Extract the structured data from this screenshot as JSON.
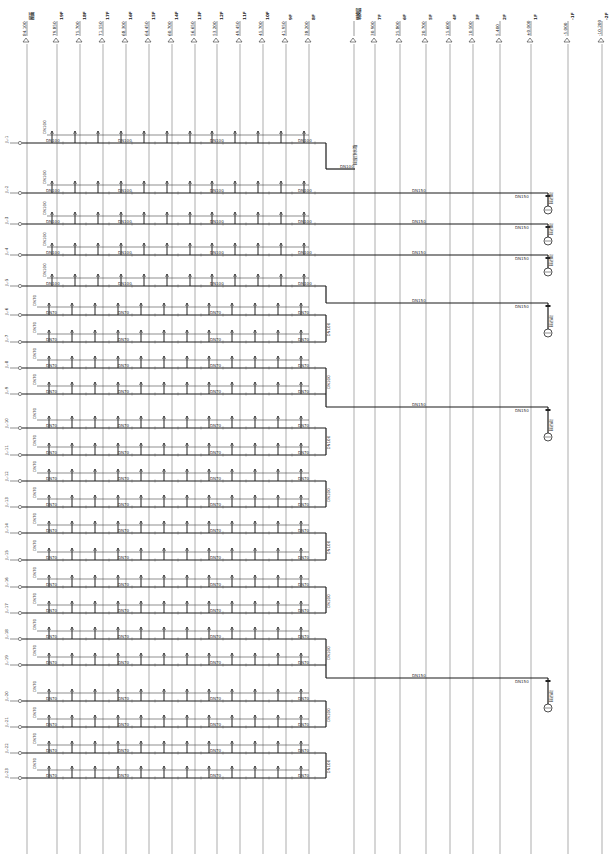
{
  "drawing": {
    "title": "Water supply riser system diagram",
    "width": 610,
    "height": 854
  },
  "levels": [
    {
      "x": 27,
      "elevation": "84.100",
      "floor": "屋面"
    },
    {
      "x": 57,
      "elevation": "79.850",
      "floor": "19F"
    },
    {
      "x": 80,
      "elevation": "75.700",
      "floor": "18F"
    },
    {
      "x": 103,
      "elevation": "71.550",
      "floor": "17F"
    },
    {
      "x": 126,
      "elevation": "68.300",
      "floor": "16F"
    },
    {
      "x": 149,
      "elevation": "64.450",
      "floor": "15F"
    },
    {
      "x": 172,
      "elevation": "60.700",
      "floor": "14F"
    },
    {
      "x": 195,
      "elevation": "56.650",
      "floor": "13F"
    },
    {
      "x": 217,
      "elevation": "53.200",
      "floor": "12F"
    },
    {
      "x": 240,
      "elevation": "49.450",
      "floor": "11F"
    },
    {
      "x": 263,
      "elevation": "45.700",
      "floor": "10F"
    },
    {
      "x": 286,
      "elevation": "41.950",
      "floor": "9F"
    },
    {
      "x": 309,
      "elevation": "38.200",
      "floor": "8F"
    },
    {
      "x": 354,
      "elevation": "",
      "floor": "转换层"
    },
    {
      "x": 375,
      "elevation": "30.900",
      "floor": "7F"
    },
    {
      "x": 400,
      "elevation": "25.800",
      "floor": "6F"
    },
    {
      "x": 426,
      "elevation": "20.700",
      "floor": "5F"
    },
    {
      "x": 450,
      "elevation": "15.600",
      "floor": "4F"
    },
    {
      "x": 473,
      "elevation": "10.500",
      "floor": "3F"
    },
    {
      "x": 500,
      "elevation": "5.400",
      "floor": "2F"
    },
    {
      "x": 531,
      "elevation": "±0.000",
      "floor": "1F"
    },
    {
      "x": 568,
      "elevation": "-5.000",
      "floor": "-1F"
    },
    {
      "x": 602,
      "elevation": "-10.200",
      "floor": "-2F"
    }
  ],
  "risers": [
    {
      "y": 143,
      "tag": "JL-1",
      "pipe": "DN100",
      "riser_label": "JL-1"
    },
    {
      "y": 193,
      "tag": "JL-2",
      "pipe": "DN100",
      "riser_label": "JL-2"
    },
    {
      "y": 224,
      "tag": "JL-3",
      "pipe": "DN100",
      "riser_label": "JL-3"
    },
    {
      "y": 255,
      "tag": "JL-4",
      "pipe": "DN100",
      "riser_label": "JL-4"
    },
    {
      "y": 286,
      "tag": "JL-5",
      "pipe": "DN100",
      "riser_label": "JL-5"
    },
    {
      "y": 315,
      "tag": "JL-6",
      "pipe": "DN70",
      "riser_label": "JL-6"
    },
    {
      "y": 342,
      "tag": "JL-7",
      "pipe": "DN70",
      "riser_label": "JL-7"
    },
    {
      "y": 368,
      "tag": "JL-8",
      "pipe": "DN70",
      "riser_label": "JL-8"
    },
    {
      "y": 394,
      "tag": "JL-9",
      "pipe": "DN70",
      "riser_label": "JL-9"
    },
    {
      "y": 428,
      "tag": "JL-10",
      "pipe": "DN70",
      "riser_label": "JL-10"
    },
    {
      "y": 455,
      "tag": "JL-11",
      "pipe": "DN70",
      "riser_label": "JL-11"
    },
    {
      "y": 481,
      "tag": "JL-12",
      "pipe": "DN70",
      "riser_label": "JL-12"
    },
    {
      "y": 507,
      "tag": "JL-13",
      "pipe": "DN70",
      "riser_label": "JL-13"
    },
    {
      "y": 533,
      "tag": "JL-14",
      "pipe": "DN70",
      "riser_label": "JL-14"
    },
    {
      "y": 560,
      "tag": "JL-15",
      "pipe": "DN70",
      "riser_label": "JL-15"
    },
    {
      "y": 587,
      "tag": "JL-16",
      "pipe": "DN70",
      "riser_label": "JL-16"
    },
    {
      "y": 613,
      "tag": "JL-17",
      "pipe": "DN70",
      "riser_label": "JL-17"
    },
    {
      "y": 639,
      "tag": "JL-18",
      "pipe": "DN70",
      "riser_label": "JL-18"
    },
    {
      "y": 665,
      "tag": "JL-19",
      "pipe": "DN70",
      "riser_label": "JL-19"
    },
    {
      "y": 701,
      "tag": "JL-20",
      "pipe": "DN70",
      "riser_label": "JL-20"
    },
    {
      "y": 727,
      "tag": "JL-21",
      "pipe": "DN70",
      "riser_label": "JL-21"
    },
    {
      "y": 753,
      "tag": "JL-22",
      "pipe": "DN70",
      "riser_label": "JL-22"
    },
    {
      "y": 778,
      "tag": "JL-23",
      "pipe": "DN70",
      "riser_label": "JL-23"
    }
  ],
  "mains": [
    {
      "from_y": 143,
      "to_y": 169,
      "end_x": 355,
      "label": "DN100",
      "note": "接屋顶水箱"
    },
    {
      "from_y": 193,
      "to_y": 193,
      "end_x": 548,
      "label": "DN150",
      "fixture_y": 210,
      "fixture_label": "接市政",
      "valve": "DN150"
    },
    {
      "from_y": 224,
      "to_y": 224,
      "end_x": 548,
      "label": "DN150",
      "fixture_y": 241,
      "fixture_label": "接市政",
      "valve": "DN150"
    },
    {
      "from_y": 255,
      "to_y": 255,
      "end_x": 548,
      "label": "DN150",
      "fixture_y": 272,
      "fixture_label": "接市政",
      "valve": "DN150"
    },
    {
      "from_y": 286,
      "to_y": 303,
      "end_x": 548,
      "label": "DN150",
      "fixture_y": 333,
      "fixture_label": "接市政",
      "valve": "DN150"
    },
    {
      "from_y": 394,
      "to_y": 407,
      "end_x": 548,
      "label": "DN150",
      "fixture_y": 437,
      "fixture_label": "接市政",
      "valve": "DN150"
    },
    {
      "from_y": 665,
      "to_y": 678,
      "end_x": 548,
      "label": "DN150",
      "fixture_y": 708,
      "fixture_label": "接市政",
      "valve": "DN150"
    }
  ],
  "labels": {
    "floor_pipe": "DN100",
    "branch_pipe": "DN70",
    "riser_note": "DN100"
  }
}
